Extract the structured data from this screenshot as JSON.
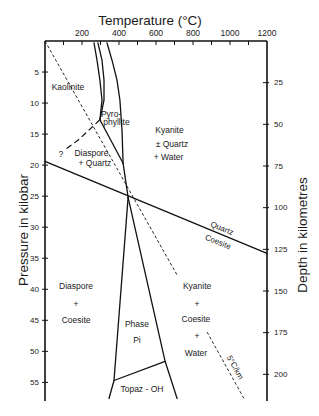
{
  "chart_data": {
    "type": "line",
    "title": "",
    "xlabel": "Temperature (°C)",
    "ylabel": "Pressure in kilobar",
    "y2label": "Depth in kilometres",
    "x_axis_position": "top",
    "xlim": [
      0,
      1200
    ],
    "ylim": [
      0,
      58
    ],
    "y2lim": [
      0,
      216
    ],
    "grid": false,
    "legend": "none",
    "x_ticks": [
      100,
      200,
      300,
      400,
      500,
      600,
      700,
      800,
      900,
      1000,
      1100
    ],
    "x_tick_labels": [
      {
        "value": 200,
        "label": "200"
      },
      {
        "value": 400,
        "label": "400"
      },
      {
        "value": 600,
        "label": "600"
      },
      {
        "value": 800,
        "label": "800"
      },
      {
        "value": 1000,
        "label": "1000"
      },
      {
        "value": 1200,
        "label": "1200"
      }
    ],
    "y_ticks": [
      {
        "value": 5,
        "label": "5"
      },
      {
        "value": 10,
        "label": "10"
      },
      {
        "value": 15,
        "label": "15"
      },
      {
        "value": 20,
        "label": "20"
      },
      {
        "value": 25,
        "label": "25"
      },
      {
        "value": 30,
        "label": "30"
      },
      {
        "value": 35,
        "label": "35"
      },
      {
        "value": 40,
        "label": "40"
      },
      {
        "value": 45,
        "label": "45"
      },
      {
        "value": 50,
        "label": "50"
      },
      {
        "value": 55,
        "label": "55"
      }
    ],
    "y2_ticks": [
      {
        "value": 25,
        "label": "25"
      },
      {
        "value": 50,
        "label": "50"
      },
      {
        "value": 75,
        "label": "75"
      },
      {
        "value": 100,
        "label": "100"
      },
      {
        "value": 125,
        "label": "125"
      },
      {
        "value": 150,
        "label": "150"
      },
      {
        "value": 175,
        "label": "175"
      },
      {
        "value": 200,
        "label": "200"
      }
    ],
    "series": [
      {
        "id": "kaolinite-pyrophyllite-a",
        "name": "Kaolinite–Pyrophyllite (a)",
        "style": "solid",
        "segments": [
          [
            [
              265,
              0.3
            ],
            [
              281,
              3.1
            ],
            [
              297,
              6.3
            ],
            [
              308,
              9.5
            ],
            [
              297,
              12.7
            ]
          ]
        ]
      },
      {
        "id": "kaolinite-pyrophyllite-b",
        "name": "Kaolinite–Pyrophyllite (b)",
        "style": "solid",
        "segments": [
          [
            [
              286,
              0.3
            ],
            [
              308,
              3.1
            ],
            [
              319,
              6.3
            ],
            [
              319,
              9.5
            ],
            [
              297,
              12.7
            ]
          ]
        ]
      },
      {
        "id": "pyrophyllite-kyanite",
        "name": "Pyrophyllite–Kyanite",
        "style": "solid",
        "segments": [
          [
            [
              335,
              0.3
            ],
            [
              362,
              3.1
            ],
            [
              389,
              6.3
            ],
            [
              405,
              9.5
            ],
            [
              416,
              14.4
            ],
            [
              422,
              19.7
            ]
          ]
        ]
      },
      {
        "id": "pyrophyllite-diaspore-quartz",
        "name": "Pyrophyllite–Diaspore+Quartz",
        "style": "solid",
        "segments": [
          [
            [
              297,
              12.7
            ],
            [
              422,
              19.7
            ]
          ]
        ]
      },
      {
        "id": "kaolinite-diaspore-quartz",
        "name": "Kaolinite–Diaspore+Quartz (uncertain)",
        "style": "longdash",
        "segments": [
          [
            [
              297,
              12.7
            ],
            [
              243,
              14.2
            ],
            [
              178,
              16.0
            ],
            [
              103,
              17.6
            ]
          ]
        ]
      },
      {
        "id": "diaspore-quartz-kyanite",
        "name": "Diaspore+Quartz–Kyanite",
        "style": "solid",
        "segments": [
          [
            [
              422,
              19.7
            ],
            [
              449,
              25.2
            ]
          ]
        ]
      },
      {
        "id": "quartz-coesite",
        "name": "Quartz–Coesite",
        "style": "solid",
        "segments": [
          [
            [
              0,
              19.4
            ],
            [
              1200,
              34.2
            ]
          ]
        ]
      },
      {
        "id": "diaspore-coesite-phase-pi",
        "name": "Diaspore+Coesite–Phase Pi",
        "style": "solid",
        "segments": [
          [
            [
              449,
              25.2
            ],
            [
              373,
              54.7
            ],
            [
              346,
              57.6
            ]
          ]
        ]
      },
      {
        "id": "phase-pi-kyanite-coesite-water",
        "name": "Phase Pi–Kyanite+Coesite+Water",
        "style": "solid",
        "segments": [
          [
            [
              449,
              25.2
            ],
            [
              649,
              51.6
            ],
            [
              714,
              57.6
            ]
          ]
        ]
      },
      {
        "id": "phase-pi-topaz-oh",
        "name": "Phase Pi–Topaz-OH",
        "style": "solid",
        "segments": [
          [
            [
              373,
              54.7
            ],
            [
              649,
              51.6
            ]
          ]
        ]
      },
      {
        "id": "geotherm-5c-per-km",
        "name": "5°C/km geotherm",
        "style": "dashed",
        "segments": [
          [
            [
              0,
              0
            ],
            [
              714,
              37.7
            ]
          ],
          [
            [
              876,
              46.9
            ],
            [
              1081,
              57.9
            ]
          ]
        ]
      }
    ],
    "annotations": [
      {
        "text": "Kaolinite",
        "x": 124,
        "y": 7.4
      },
      {
        "text": "Pyro-",
        "x": 357,
        "y": 11.8
      },
      {
        "text": "phyllite",
        "x": 386,
        "y": 13.1
      },
      {
        "text": "Kyanite",
        "x": 673,
        "y": 14.4
      },
      {
        "text": "± Quartz",
        "x": 686,
        "y": 16.6
      },
      {
        "text": "+ Water",
        "x": 668,
        "y": 18.7
      },
      {
        "text": "?",
        "x": 86,
        "y": 18.2
      },
      {
        "text": "Diaspore",
        "x": 251,
        "y": 18.1
      },
      {
        "text": "+ Quartz",
        "x": 270,
        "y": 19.7
      },
      {
        "text": "Quartz",
        "x": 957,
        "y": 30.2,
        "align_to": "quartz-coesite"
      },
      {
        "text": "Coesite",
        "x": 935,
        "y": 32.4,
        "align_to": "quartz-coesite"
      },
      {
        "text": "Diaspore",
        "x": 168,
        "y": 39.4
      },
      {
        "text": "+",
        "x": 168,
        "y": 42.3
      },
      {
        "text": "Coesite",
        "x": 168,
        "y": 45.0
      },
      {
        "text": "Phase",
        "x": 497,
        "y": 45.6
      },
      {
        "text": "Pi",
        "x": 497,
        "y": 48.2
      },
      {
        "text": "Kyanite",
        "x": 822,
        "y": 39.4
      },
      {
        "text": "+",
        "x": 822,
        "y": 42.3
      },
      {
        "text": "Coesite",
        "x": 816,
        "y": 44.8
      },
      {
        "text": "+",
        "x": 822,
        "y": 47.6
      },
      {
        "text": "Water",
        "x": 816,
        "y": 50.2
      },
      {
        "text": "Topaz - OH",
        "x": 524,
        "y": 56.1
      },
      {
        "text": "5°C/km",
        "x": 1027,
        "y": 52.6,
        "align_to": "geotherm-5c-per-km",
        "segment": 1
      }
    ]
  }
}
